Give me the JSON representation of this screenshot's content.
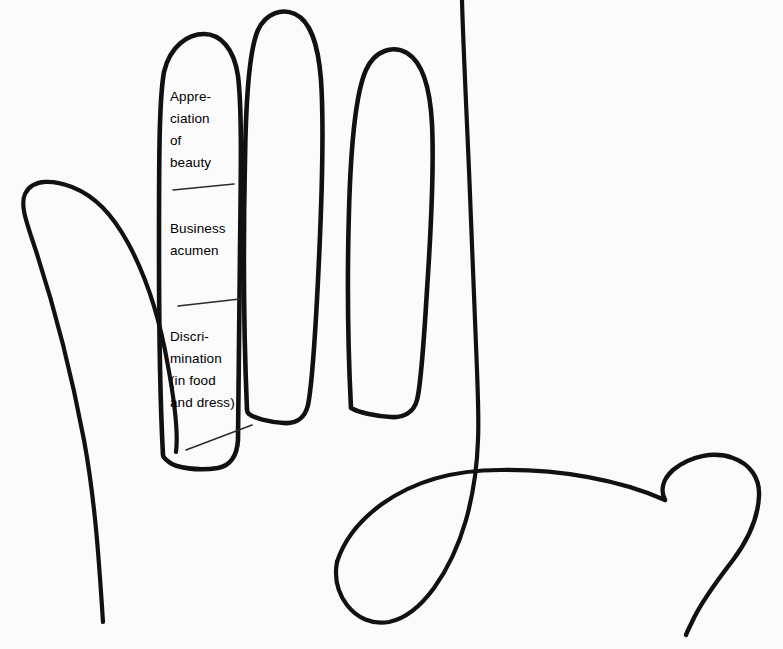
{
  "diagram": {
    "type": "hand-outline-palmistry",
    "background_color": "#fbfbfb",
    "stroke_color": "#111111",
    "leader_line_color": "#2b2b2b",
    "annotated_digit": "index-finger",
    "annotations": [
      {
        "id": "appreciation-of-beauty",
        "phalanx": "top",
        "lines": [
          "Appre-",
          "ciation",
          "of",
          "beauty"
        ],
        "text": "Appreciation of beauty"
      },
      {
        "id": "business-acumen",
        "phalanx": "middle",
        "lines": [
          "Business",
          "acumen"
        ],
        "text": "Business acumen"
      },
      {
        "id": "discrimination",
        "phalanx": "bottom",
        "lines": [
          "Discri-",
          "mination",
          "(in food",
          "and dress)"
        ],
        "text": "Discrimination (in food and dress)"
      }
    ]
  }
}
